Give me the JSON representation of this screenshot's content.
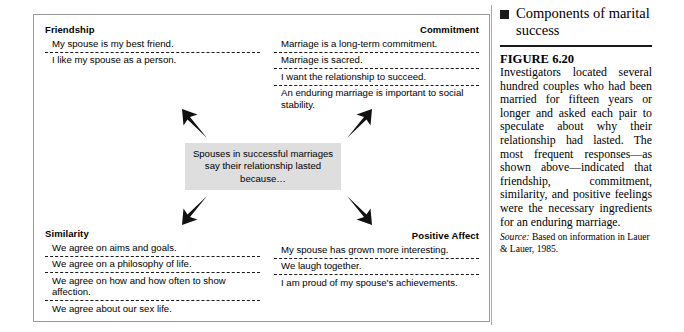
{
  "figure": {
    "center_box": {
      "text": "Spouses in successful marriages say their relationship lasted because…"
    },
    "arrows": {
      "upper_left": "arrow-up-left-icon",
      "upper_right": "arrow-up-right-icon",
      "lower_left": "arrow-down-left-icon",
      "lower_right": "arrow-down-right-icon"
    },
    "quadrants": [
      {
        "key": "friendship",
        "title": "Friendship",
        "items": [
          "My spouse is my best friend.",
          "I like my spouse as a person."
        ]
      },
      {
        "key": "commitment",
        "title": "Commitment",
        "items": [
          "Marriage is a long-term commitment.",
          "Marriage is sacred.",
          "I want the relationship to succeed.",
          "An enduring marriage is important to social stability."
        ]
      },
      {
        "key": "similarity",
        "title": "Similarity",
        "items": [
          "We agree on aims and goals.",
          "We agree on a philosophy of life.",
          "We agree on how and how often to show affection.",
          "We agree about our sex life."
        ]
      },
      {
        "key": "positive_affect",
        "title": "Positive Affect",
        "items": [
          "My spouse has grown more interesting.",
          "We laugh together.",
          "I am proud of my spouse's achievements."
        ]
      }
    ]
  },
  "sidebar": {
    "bullet_icon": "filled-square-icon",
    "heading": "Components of marital success",
    "figure_label": "FIGURE 6.20",
    "body": "Investigators located several hundred couples who had been married for fifteen years or longer and asked each pair to speculate about why their relationship had lasted. The most frequent responses—as shown above—indicated that friendship, commitment, similarity, and positive feelings were the necessary ingredients for an enduring marriage.",
    "source_word": "Source:",
    "source_text": " Based on information in Lauer & Lauer, 1985."
  },
  "colors": {
    "center_box_fill": "#dedede",
    "frame_border": "#9a9a9a",
    "text": "#000000",
    "rule": "#1a1a1a"
  }
}
